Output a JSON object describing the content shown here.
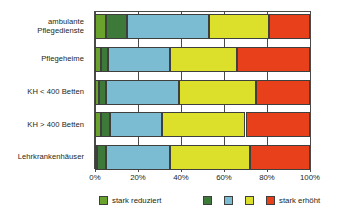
{
  "chart_data": {
    "type": "bar",
    "orientation": "horizontal",
    "stacked": true,
    "normalized_percent": true,
    "title": "",
    "subtitle": "",
    "xlabel": "",
    "ylabel": "",
    "xlim": [
      0,
      100
    ],
    "xticks": [
      0,
      20,
      40,
      60,
      80,
      100
    ],
    "xticklabels": [
      "0%",
      "20%",
      "40%",
      "60%",
      "80%",
      "100%"
    ],
    "grid": true,
    "legend_position": "bottom",
    "categories": [
      "ambulante Pflegedienste",
      "Pflegeheime",
      "KH < 400 Betten",
      "KH > 400 Betten",
      "Lehrkrankenhäuser"
    ],
    "category_lines": [
      [
        "ambulante",
        "Pflegedienste"
      ],
      [
        "Pflegeheime"
      ],
      [
        "KH < 400 Betten"
      ],
      [
        "KH > 400 Betten"
      ],
      [
        "Lehrkrankenhäuser"
      ]
    ],
    "series": [
      {
        "name": "stark reduziert",
        "color": "#6aa22e",
        "values": [
          5,
          3,
          2,
          3,
          1
        ]
      },
      {
        "name": "",
        "color": "#3d7a3a",
        "values": [
          10,
          3,
          3,
          4,
          4
        ]
      },
      {
        "name": "",
        "color": "#7cbcd2",
        "values": [
          38,
          29,
          34,
          24,
          30
        ]
      },
      {
        "name": "",
        "color": "#dde02a",
        "values": [
          28,
          31,
          36,
          39,
          37
        ]
      },
      {
        "name": "stark erhöht",
        "color": "#e8401a",
        "values": [
          19,
          34,
          25,
          30,
          28
        ]
      }
    ]
  },
  "legend": {
    "items": [
      {
        "label": "stark reduziert",
        "color": "#6aa22e"
      },
      {
        "label": "",
        "color": "#3d7a3a"
      },
      {
        "label": "",
        "color": "#7cbcd2"
      },
      {
        "label": "",
        "color": "#dde02a"
      },
      {
        "label": "stark erhöht",
        "color": "#e8401a"
      }
    ]
  },
  "axis": {
    "tick_labels": [
      "0%",
      "20%",
      "40%",
      "60%",
      "80%",
      "100%"
    ]
  },
  "style": {
    "background": "#ffffff",
    "frame_color": "#4a4a48",
    "text_color": "#231f20"
  }
}
